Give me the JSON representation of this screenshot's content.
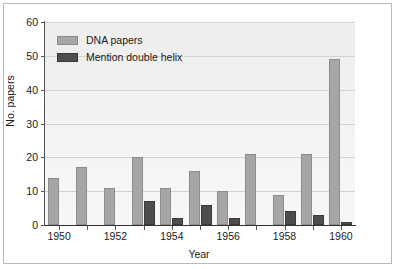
{
  "chart_data": {
    "type": "bar",
    "title": "",
    "xlabel": "Year",
    "ylabel": "No. papers",
    "grid": true,
    "legend_position": "upper-left",
    "ylim": [
      0,
      60
    ],
    "yticks": [
      0,
      10,
      20,
      30,
      40,
      50,
      60
    ],
    "xticks": [
      1950,
      1952,
      1954,
      1956,
      1958,
      1960
    ],
    "categories": [
      1950,
      1951,
      1952,
      1953,
      1954,
      1955,
      1956,
      1957,
      1958,
      1959,
      1960
    ],
    "series": [
      {
        "name": "DNA papers",
        "color": "#a6a6a6",
        "values": [
          14,
          17,
          11,
          20,
          11,
          16,
          10,
          21,
          9,
          21,
          49
        ]
      },
      {
        "name": "Mention double helix",
        "color": "#4d4d4d",
        "values": [
          0,
          0,
          0,
          7,
          2,
          6,
          2,
          0,
          4,
          3,
          1
        ]
      }
    ]
  },
  "axis": {
    "ylabel": "No. papers",
    "xlabel": "Year",
    "ytick_labels": [
      "0",
      "10",
      "20",
      "30",
      "40",
      "50",
      "60"
    ],
    "xtick_labels": [
      "1950",
      "1952",
      "1954",
      "1956",
      "1958",
      "1960"
    ]
  },
  "legend": {
    "items": [
      {
        "label": "DNA papers",
        "swatch": "light-gray-swatch"
      },
      {
        "label": "Mention double helix",
        "swatch": "dark-gray-swatch"
      }
    ]
  }
}
